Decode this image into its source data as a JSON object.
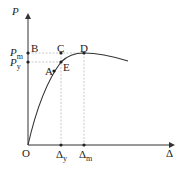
{
  "diagram": {
    "axes": {
      "y_label": "P",
      "x_label": "Δ",
      "origin_label": "O"
    },
    "y_ticks": [
      {
        "main": "P",
        "sub": "m"
      },
      {
        "main": "P",
        "sub": "y"
      }
    ],
    "x_ticks": [
      {
        "main": "Δ",
        "sub": "y"
      },
      {
        "main": "Δ",
        "sub": "m"
      }
    ],
    "points": [
      "A",
      "B",
      "C",
      "D",
      "E"
    ],
    "colors": {
      "line": "#333333",
      "guide": "#bbbbbb"
    }
  }
}
